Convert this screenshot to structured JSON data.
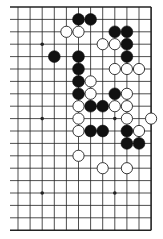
{
  "diagram": {
    "type": "go-board-partial",
    "board_size": 19,
    "visible_columns": 12,
    "visible_rows": 19,
    "note": "Right portion of a 19x19 board; local column 0 = board column 8, local column 11 = right edge.",
    "colors": {
      "line": "#222222",
      "black_stone": "#111111",
      "white_stone": "#ffffff",
      "background": "#ffffff"
    },
    "star_points": [
      [
        2,
        3
      ],
      [
        8,
        3
      ],
      [
        2,
        9
      ],
      [
        8,
        9
      ],
      [
        2,
        15
      ],
      [
        8,
        15
      ]
    ],
    "black_stones": [
      [
        5,
        1
      ],
      [
        6,
        1
      ],
      [
        8,
        2
      ],
      [
        9,
        2
      ],
      [
        9,
        3
      ],
      [
        3,
        4
      ],
      [
        5,
        4
      ],
      [
        9,
        4
      ],
      [
        5,
        5
      ],
      [
        5,
        6
      ],
      [
        5,
        7
      ],
      [
        8,
        7
      ],
      [
        6,
        8
      ],
      [
        7,
        8
      ],
      [
        6,
        10
      ],
      [
        7,
        10
      ],
      [
        9,
        10
      ],
      [
        9,
        11
      ],
      [
        10,
        11
      ]
    ],
    "white_stones": [
      [
        4,
        2
      ],
      [
        5,
        2
      ],
      [
        7,
        3
      ],
      [
        8,
        3
      ],
      [
        8,
        5
      ],
      [
        9,
        5
      ],
      [
        10,
        5
      ],
      [
        6,
        6
      ],
      [
        6,
        7
      ],
      [
        9,
        7
      ],
      [
        5,
        8
      ],
      [
        8,
        8
      ],
      [
        9,
        8
      ],
      [
        5,
        9
      ],
      [
        9,
        9
      ],
      [
        11,
        9
      ],
      [
        5,
        10
      ],
      [
        10,
        10
      ],
      [
        5,
        12
      ],
      [
        7,
        13
      ],
      [
        9,
        13
      ]
    ]
  }
}
